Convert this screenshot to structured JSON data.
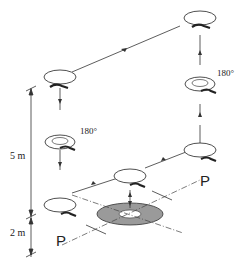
{
  "diagram": {
    "type": "helicopter flight path (isometric)",
    "labels": {
      "rotation_left": "180°",
      "rotation_right": "180°",
      "height_upper": "5 m",
      "height_lower": "2 m",
      "plane_left": "P",
      "plane_right": "P"
    },
    "colors": {
      "line": "#333333",
      "pad_fill": "#9a9a9a",
      "background": "#ffffff"
    },
    "positions": [
      {
        "id": "top-right",
        "note": "high hover, rear right"
      },
      {
        "id": "top-left",
        "note": "high hover, rear left"
      },
      {
        "id": "mid-left-rotate",
        "note": "180° yaw turn"
      },
      {
        "id": "mid-right-rotate",
        "note": "180° yaw turn"
      },
      {
        "id": "low-left",
        "note": "2 m hover"
      },
      {
        "id": "low-center",
        "note": "over landing pad"
      },
      {
        "id": "low-right",
        "note": "2 m hover"
      }
    ]
  }
}
